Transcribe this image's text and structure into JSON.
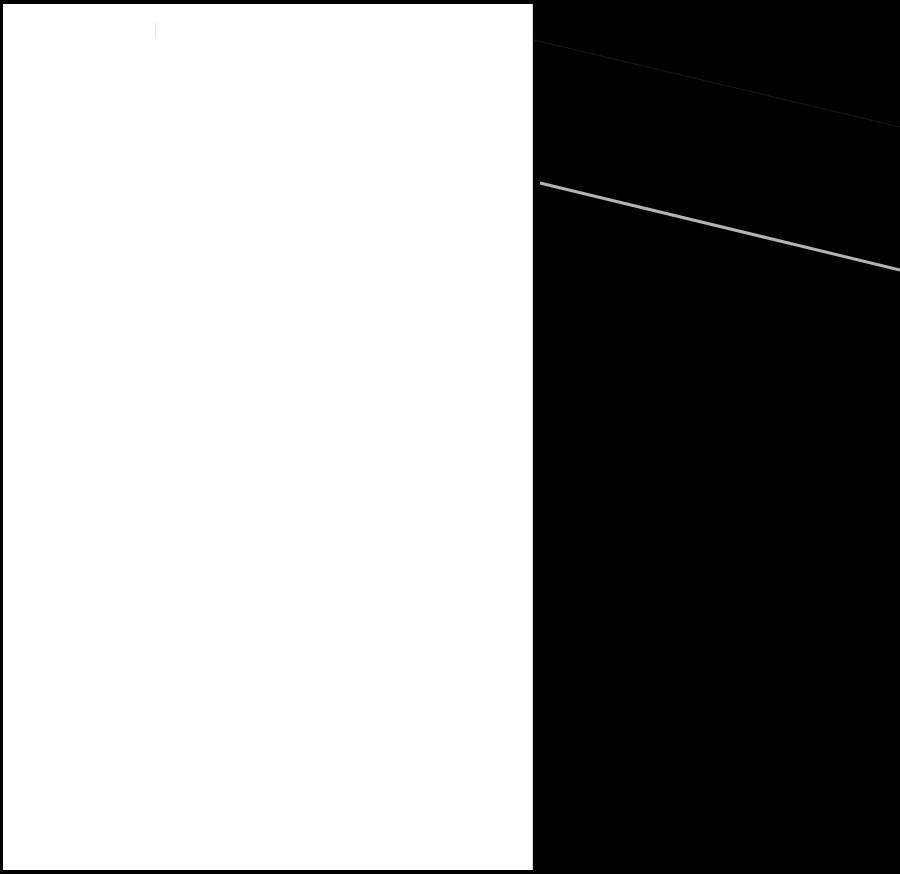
{
  "canvas": {
    "background_color": "#000000",
    "panel_color": "#ffffff",
    "width": 900,
    "height": 874
  },
  "lines": [
    {
      "name": "faint-diagonal-line",
      "x1": 534,
      "y1": 40,
      "x2": 900,
      "y2": 127,
      "color": "#1a1a1a",
      "width": 1
    },
    {
      "name": "grey-diagonal-line",
      "x1": 540,
      "y1": 183,
      "x2": 900,
      "y2": 270,
      "color": "#b4b4b4",
      "width": 3
    }
  ]
}
